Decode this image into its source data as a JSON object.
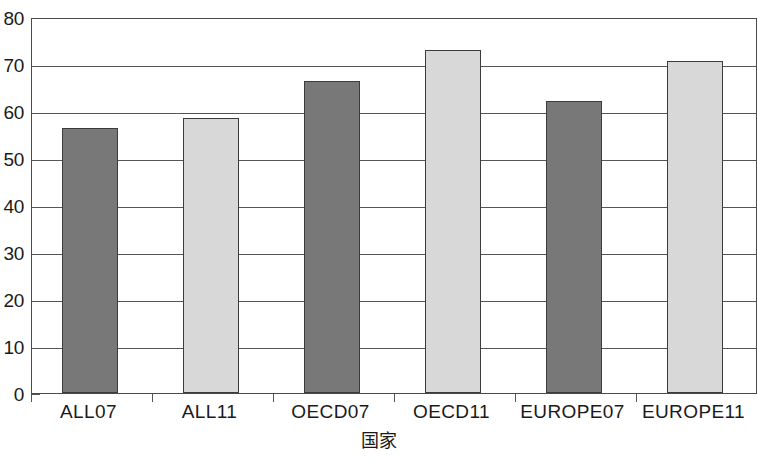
{
  "chart_data": {
    "type": "bar",
    "title": "",
    "subtitle": "",
    "xlabel": "国家",
    "ylabel": "",
    "categories": [
      "ALL07",
      "ALL11",
      "OECD07",
      "OECD11",
      "EUROPE07",
      "EUROPE11"
    ],
    "values": [
      56.3,
      58.5,
      66.4,
      73.0,
      62.2,
      70.6
    ],
    "series": [
      {
        "name": "",
        "values": [
          56.3,
          58.5,
          66.4,
          73.0,
          62.2,
          70.6
        ]
      }
    ],
    "ylim": [
      0,
      80
    ],
    "xlim": [
      0,
      6
    ],
    "ytick_labels": [
      "0",
      "10",
      "20",
      "30",
      "40",
      "50",
      "60",
      "70",
      "80"
    ],
    "ytick_values": [
      0,
      10,
      20,
      30,
      40,
      50,
      60,
      70,
      80
    ],
    "grid": true,
    "grid_axis": "y",
    "legend": false,
    "legend_position": "none",
    "annotations": [],
    "bar_colors": [
      "#787878",
      "#d8d8d8",
      "#787878",
      "#d8d8d8",
      "#787878",
      "#d8d8d8"
    ],
    "bar_border_color": "#3c3c3c",
    "axis_color": "#4a4a4a",
    "grid_color": "#555555",
    "background_color": "#ffffff",
    "text_color": "#1a1a1a"
  }
}
